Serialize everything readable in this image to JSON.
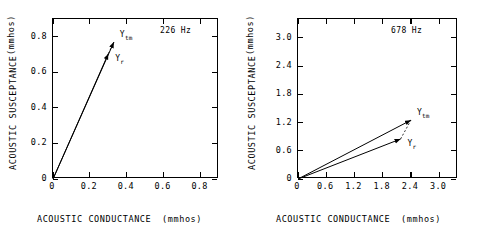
{
  "figure": {
    "type": "vector-admittance-plots",
    "panel_count": 2
  },
  "chart_data": [
    {
      "type": "scatter",
      "title": "",
      "annotation": "226 Hz",
      "xlabel": "ACOUSTIC CONDUCTANCE",
      "xunit": "(mmhos)",
      "ylabel": "ACOUSTIC SUSCEPTANCE",
      "yunit": "(mmhos)",
      "xlim": [
        0,
        0.9
      ],
      "ylim": [
        0,
        0.9
      ],
      "xticks": [
        0,
        0.2,
        0.4,
        0.6,
        0.8
      ],
      "xticklabels": [
        "0",
        "0.2",
        "0.4",
        "0.6",
        "0.8"
      ],
      "yticks": [
        0,
        0.2,
        0.4,
        0.6,
        0.8
      ],
      "yticklabels": [
        "0",
        "0.2",
        "0.4",
        "0.6",
        "0.8"
      ],
      "grid": false,
      "legend": "none",
      "vectors": [
        {
          "name": "Y_tm",
          "label": "Y",
          "sub": "tm",
          "x0": 0.0,
          "y0": 0.0,
          "x1": 0.33,
          "y1": 0.77
        },
        {
          "name": "Y_r",
          "label": "Y",
          "sub": "r",
          "x0": 0.0,
          "y0": 0.0,
          "x1": 0.3,
          "y1": 0.705
        }
      ],
      "connector": {
        "dashed": true,
        "from": "Y_r",
        "to": "Y_tm"
      }
    },
    {
      "type": "scatter",
      "title": "",
      "annotation": "678 Hz",
      "xlabel": "ACOUSTIC CONDUCTANCE",
      "xunit": "(mmhos)",
      "ylabel": "ACOUSTIC SUSCEPTANCE",
      "yunit": "(mmhos)",
      "xlim": [
        0,
        3.4
      ],
      "ylim": [
        0,
        3.4
      ],
      "xticks": [
        0,
        0.6,
        1.2,
        1.8,
        2.4,
        3.0
      ],
      "xticklabels": [
        "0",
        "0.6",
        "1.2",
        "1.8",
        "2.4",
        "3.0"
      ],
      "yticks": [
        0,
        0.6,
        1.2,
        1.8,
        2.4,
        3.0
      ],
      "yticklabels": [
        "0",
        "0.6",
        "1.2",
        "1.8",
        "2.4",
        "3.0"
      ],
      "grid": false,
      "legend": "none",
      "vectors": [
        {
          "name": "Y_tm",
          "label": "Y",
          "sub": "tm",
          "x0": 0.0,
          "y0": 0.0,
          "x1": 2.4,
          "y1": 1.25
        },
        {
          "name": "Y_r",
          "label": "Y",
          "sub": "r",
          "x0": 0.0,
          "y0": 0.0,
          "x1": 2.18,
          "y1": 0.85
        }
      ],
      "connector": {
        "dashed": true,
        "from": "Y_r",
        "to": "Y_tm"
      }
    }
  ],
  "colors": {
    "background": "#ffffff",
    "ink": "#000000"
  }
}
